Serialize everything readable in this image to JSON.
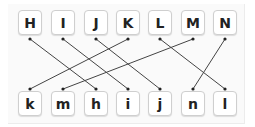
{
  "puzzle": {
    "top_row": [
      {
        "label": "H",
        "x": 30
      },
      {
        "label": "I",
        "x": 63
      },
      {
        "label": "J",
        "x": 96
      },
      {
        "label": "K",
        "x": 128
      },
      {
        "label": "L",
        "x": 160
      },
      {
        "label": "M",
        "x": 193
      },
      {
        "label": "N",
        "x": 225
      }
    ],
    "bottom_row": [
      {
        "label": "k",
        "x": 30
      },
      {
        "label": "m",
        "x": 63
      },
      {
        "label": "h",
        "x": 96
      },
      {
        "label": "i",
        "x": 128
      },
      {
        "label": "j",
        "x": 160
      },
      {
        "label": "n",
        "x": 193
      },
      {
        "label": "l",
        "x": 225
      }
    ],
    "connections": [
      {
        "from": "H",
        "to": "h"
      },
      {
        "from": "I",
        "to": "i"
      },
      {
        "from": "J",
        "to": "j"
      },
      {
        "from": "K",
        "to": "k"
      },
      {
        "from": "L",
        "to": "l"
      },
      {
        "from": "M",
        "to": "m"
      },
      {
        "from": "N",
        "to": "n"
      }
    ],
    "line_color": "#444444"
  }
}
